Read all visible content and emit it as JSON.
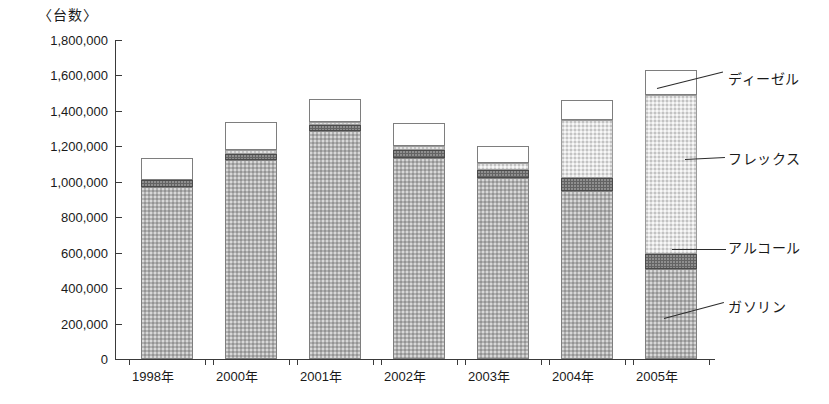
{
  "chart_data": {
    "type": "bar",
    "stacked": true,
    "title": "〈台数〉",
    "xlabel": "",
    "ylabel": "台数",
    "ylim": [
      0,
      1800000
    ],
    "ytick_step": 200000,
    "ytick_labels": [
      "1,800,000",
      "1,600,000",
      "1,400,000",
      "1,200,000",
      "1,000,000",
      "800,000",
      "600,000",
      "400,000",
      "200,000",
      "0"
    ],
    "ytick_values": [
      1800000,
      1600000,
      1400000,
      1200000,
      1000000,
      800000,
      600000,
      400000,
      200000,
      0
    ],
    "grid": false,
    "legend_position": "right-callout",
    "categories": [
      "1998年",
      "2000年",
      "2001年",
      "2002年",
      "2003年",
      "2004年",
      "2005年"
    ],
    "series": [
      {
        "name": "ガソリン",
        "color": "#b0b0b0",
        "values": [
          970000,
          1125000,
          1285000,
          1135000,
          1020000,
          950000,
          510000
        ]
      },
      {
        "name": "アルコール",
        "color": "#636363",
        "values": [
          40000,
          30000,
          35000,
          45000,
          45000,
          70000,
          80000
        ]
      },
      {
        "name": "フレックス",
        "color": "#e3e3e3",
        "values": [
          0,
          25000,
          20000,
          20000,
          40000,
          330000,
          900000
        ]
      },
      {
        "name": "ディーゼル",
        "color": "#ffffff",
        "values": [
          125000,
          155000,
          125000,
          130000,
          95000,
          110000,
          140000
        ]
      }
    ],
    "totals": [
      1135000,
      1335000,
      1465000,
      1330000,
      1200000,
      1460000,
      1630000
    ],
    "annotations": [
      {
        "label": "ディーゼル",
        "series": "ディーゼル"
      },
      {
        "label": "フレックス",
        "series": "フレックス"
      },
      {
        "label": "アルコール",
        "series": "アルコール"
      },
      {
        "label": "ガソリン",
        "series": "ガソリン"
      }
    ]
  },
  "legend": {
    "diesel": "ディーゼル",
    "flex": "フレックス",
    "alcohol": "アルコール",
    "gasoline": "ガソリン"
  }
}
